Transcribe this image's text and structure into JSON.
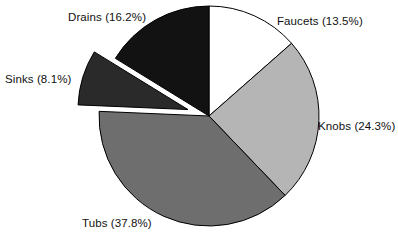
{
  "chart_data": {
    "type": "pie",
    "title": "",
    "subtitle": "",
    "xlabel": "",
    "ylabel": "",
    "legend_position": "none",
    "grid": false,
    "start_angle_deg": 90,
    "direction": "clockwise",
    "categories": [
      "Faucets",
      "Knobs",
      "Tubs",
      "Sinks",
      "Drains"
    ],
    "values": [
      13.5,
      24.3,
      37.8,
      8.1,
      16.2
    ],
    "units": "percent",
    "labels": [
      "Faucets (13.5%)",
      "Knobs (24.3%)",
      "Tubs (37.8%)",
      "Sinks (8.1%)",
      "Drains (16.2%)"
    ],
    "slice_colors": [
      "#ffffff",
      "#b5b5b5",
      "#6e6e6e",
      "#2a2a2a",
      "#121212"
    ],
    "edge_color": "#000000",
    "exploded": [
      "Sinks"
    ],
    "slices": [
      {
        "name": "Faucets",
        "value": 13.5,
        "label": "Faucets (13.5%)",
        "color": "#ffffff",
        "exploded": false
      },
      {
        "name": "Knobs",
        "value": 24.3,
        "label": "Knobs (24.3%)",
        "color": "#b5b5b5",
        "exploded": false
      },
      {
        "name": "Tubs",
        "value": 37.8,
        "label": "Tubs (37.8%)",
        "color": "#6e6e6e",
        "exploded": false
      },
      {
        "name": "Sinks",
        "value": 8.1,
        "label": "Sinks (8.1%)",
        "color": "#2a2a2a",
        "exploded": true
      },
      {
        "name": "Drains",
        "value": 16.2,
        "label": "Drains (16.2%)",
        "color": "#121212",
        "exploded": false
      }
    ]
  },
  "figure": {
    "background": "#ffffff",
    "center_x": 209,
    "center_y": 116,
    "radius": 110,
    "explode_offset": 22
  },
  "labels": {
    "faucets": "Faucets (13.5%)",
    "knobs": "Knobs (24.3%)",
    "tubs": "Tubs (37.8%)",
    "sinks": "Sinks (8.1%)",
    "drains": "Drains (16.2%)"
  }
}
